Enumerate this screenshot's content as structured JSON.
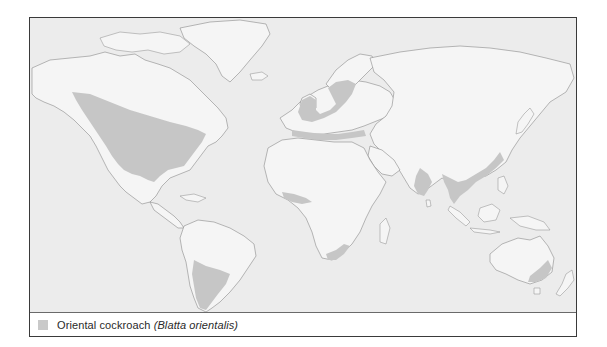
{
  "map": {
    "title": "",
    "subject": "World distribution of the Oriental cockroach",
    "colors": {
      "ocean": "#ececec",
      "land": "#f5f5f5",
      "coastline": "#8a8a8a",
      "range": "#c6c6c6",
      "frame": "#3a3a3a"
    },
    "shaded_regions": [
      "Western and central North America (southern Canada and USA)",
      "British Isles and north-western/northern Europe (incl. southern Scandinavia)",
      "Mediterranean coasts of southern Europe and North Africa",
      "West African coast (Gulf of Guinea)",
      "South-eastern coast of South Africa",
      "Southern India and Sri Lanka",
      "Mainland South-east Asia and southern China coast",
      "Southern Argentina / Patagonia",
      "South-eastern Australia"
    ]
  },
  "legend": {
    "items": [
      {
        "label": "Oriental cockroach",
        "scientific_name": "(Blatta orientalis)",
        "swatch_color": "#c9c9c9"
      }
    ]
  }
}
